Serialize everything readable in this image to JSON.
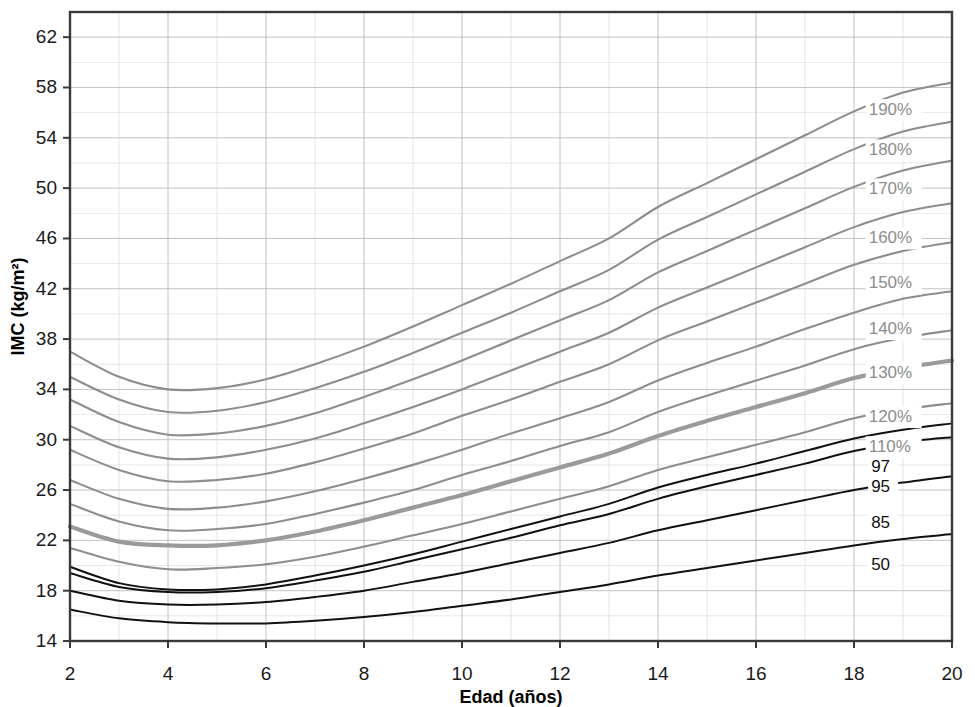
{
  "chart_data": {
    "type": "line",
    "title": "",
    "xlabel": "Edad (años)",
    "ylabel": "IMC (kg/m²)",
    "xlim": [
      2,
      20
    ],
    "ylim": [
      14,
      64
    ],
    "xticks": [
      2,
      4,
      6,
      8,
      10,
      12,
      14,
      16,
      18,
      20
    ],
    "yticks": [
      14,
      18,
      22,
      26,
      30,
      34,
      38,
      42,
      46,
      50,
      54,
      58,
      62
    ],
    "grid": "both-minor-major",
    "grid_x_step": 1,
    "grid_y_step": 2,
    "legend_position": "right-inline-labels",
    "colors": {
      "percent_line": "#8d8d8d",
      "percent_line_highlight": "#9a9a9a",
      "percentile_line": "#111111",
      "grid": "#b9b9b9",
      "axis": "#3a3a3a",
      "background": "#ffffff"
    },
    "x": [
      2,
      3,
      4,
      5,
      6,
      7,
      8,
      9,
      10,
      11,
      12,
      13,
      14,
      15,
      16,
      17,
      18,
      19,
      20
    ],
    "series": [
      {
        "name": "190%",
        "label": "190%",
        "kind": "percent",
        "emphasis": false,
        "label_x": 18.3,
        "label_y": 56.2,
        "values": [
          37.0,
          35.0,
          34.0,
          34.1,
          34.8,
          36.0,
          37.4,
          39.0,
          40.7,
          42.4,
          44.2,
          46.0,
          48.5,
          50.4,
          52.3,
          54.2,
          56.1,
          57.6,
          58.4
        ]
      },
      {
        "name": "180%",
        "label": "180%",
        "kind": "percent",
        "emphasis": false,
        "label_x": 18.3,
        "label_y": 53.0,
        "values": [
          35.0,
          33.2,
          32.2,
          32.3,
          33.0,
          34.1,
          35.4,
          36.9,
          38.5,
          40.1,
          41.8,
          43.5,
          45.9,
          47.7,
          49.5,
          51.3,
          53.1,
          54.5,
          55.3
        ]
      },
      {
        "name": "170%",
        "label": "170%",
        "kind": "percent",
        "emphasis": false,
        "label_x": 18.3,
        "label_y": 49.9,
        "values": [
          33.2,
          31.4,
          30.4,
          30.5,
          31.1,
          32.1,
          33.4,
          34.8,
          36.3,
          37.9,
          39.5,
          41.1,
          43.3,
          45.0,
          46.7,
          48.4,
          50.1,
          51.4,
          52.2
        ]
      },
      {
        "name": "160%",
        "label": "160%",
        "kind": "percent",
        "emphasis": false,
        "label_x": 18.3,
        "label_y": 46.0,
        "values": [
          31.1,
          29.4,
          28.5,
          28.6,
          29.2,
          30.1,
          31.3,
          32.6,
          34.0,
          35.5,
          37.0,
          38.5,
          40.5,
          42.1,
          43.7,
          45.3,
          46.9,
          48.1,
          48.8
        ]
      },
      {
        "name": "150%",
        "label": "150%",
        "kind": "percent",
        "emphasis": false,
        "label_x": 18.3,
        "label_y": 42.4,
        "values": [
          29.2,
          27.6,
          26.7,
          26.8,
          27.3,
          28.2,
          29.3,
          30.5,
          31.9,
          33.2,
          34.6,
          36.0,
          37.9,
          39.4,
          40.9,
          42.4,
          43.9,
          45.0,
          45.7
        ]
      },
      {
        "name": "140%",
        "label": "140%",
        "kind": "percent",
        "emphasis": false,
        "label_x": 18.3,
        "label_y": 38.8,
        "values": [
          26.8,
          25.3,
          24.5,
          24.6,
          25.1,
          25.9,
          26.9,
          28.0,
          29.2,
          30.5,
          31.7,
          33.0,
          34.7,
          36.1,
          37.4,
          38.8,
          40.1,
          41.2,
          41.8
        ]
      },
      {
        "name": "130%",
        "label": "130%",
        "kind": "percent",
        "emphasis": false,
        "label_x": 18.3,
        "label_y": 35.3,
        "values": [
          24.9,
          23.5,
          22.8,
          22.9,
          23.3,
          24.1,
          25.0,
          26.0,
          27.2,
          28.3,
          29.5,
          30.6,
          32.2,
          33.5,
          34.7,
          35.9,
          37.2,
          38.1,
          38.7
        ]
      },
      {
        "name": "120%",
        "label": "120%",
        "kind": "percent",
        "emphasis": true,
        "label_x": 18.3,
        "label_y": 31.8,
        "values": [
          23.1,
          21.9,
          21.6,
          21.6,
          22.0,
          22.7,
          23.6,
          24.6,
          25.6,
          26.7,
          27.8,
          28.9,
          30.3,
          31.5,
          32.6,
          33.7,
          34.9,
          35.7,
          36.3
        ]
      },
      {
        "name": "110%",
        "label": "110%",
        "kind": "percent",
        "emphasis": false,
        "label_x": 18.3,
        "label_y": 29.4,
        "values": [
          21.4,
          20.3,
          19.7,
          19.8,
          20.1,
          20.7,
          21.5,
          22.4,
          23.3,
          24.3,
          25.3,
          26.3,
          27.6,
          28.6,
          29.6,
          30.6,
          31.7,
          32.4,
          32.9
        ]
      },
      {
        "name": "97",
        "label": "97",
        "kind": "percentile",
        "emphasis": false,
        "label_x": 18.35,
        "label_y": 27.8,
        "values": [
          19.9,
          18.6,
          18.1,
          18.1,
          18.5,
          19.2,
          20.0,
          20.9,
          21.9,
          22.9,
          23.9,
          24.9,
          26.2,
          27.2,
          28.1,
          29.1,
          30.1,
          30.8,
          31.3
        ]
      },
      {
        "name": "95",
        "label": "95",
        "kind": "percentile",
        "emphasis": false,
        "label_x": 18.35,
        "label_y": 26.2,
        "values": [
          19.4,
          18.3,
          17.9,
          17.9,
          18.2,
          18.8,
          19.5,
          20.4,
          21.3,
          22.2,
          23.2,
          24.1,
          25.3,
          26.3,
          27.2,
          28.1,
          29.1,
          29.8,
          30.2
        ]
      },
      {
        "name": "85",
        "label": "85",
        "kind": "percentile",
        "emphasis": false,
        "label_x": 18.35,
        "label_y": 23.3,
        "values": [
          18.0,
          17.2,
          16.9,
          16.9,
          17.1,
          17.5,
          18.0,
          18.7,
          19.4,
          20.2,
          21.0,
          21.8,
          22.8,
          23.6,
          24.4,
          25.2,
          26.0,
          26.6,
          27.1
        ]
      },
      {
        "name": "50",
        "label": "50",
        "kind": "percentile",
        "emphasis": false,
        "label_x": 18.35,
        "label_y": 20.0,
        "values": [
          16.5,
          15.8,
          15.5,
          15.4,
          15.4,
          15.6,
          15.9,
          16.3,
          16.8,
          17.3,
          17.9,
          18.5,
          19.2,
          19.8,
          20.4,
          21.0,
          21.6,
          22.1,
          22.5
        ]
      }
    ]
  },
  "axes": {
    "x_title": "Edad (años)",
    "y_title": "IMC (kg/m²)",
    "x_tick_labels": [
      "2",
      "4",
      "6",
      "8",
      "10",
      "12",
      "14",
      "16",
      "18",
      "20"
    ],
    "y_tick_labels": [
      "14",
      "18",
      "22",
      "26",
      "30",
      "34",
      "38",
      "42",
      "46",
      "50",
      "54",
      "58",
      "62"
    ]
  }
}
